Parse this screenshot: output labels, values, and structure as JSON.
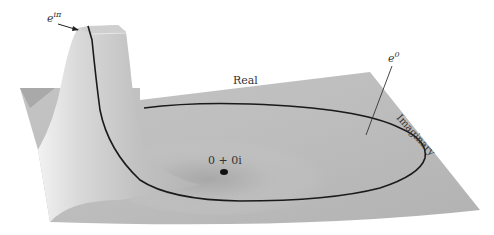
{
  "figure": {
    "labels": {
      "e_i_pi": "e",
      "e_i_pi_sup": "iπ",
      "e_zero": "e",
      "e_zero_sup": "0",
      "real_axis": "Real",
      "imaginary_axis": "Imaginary",
      "origin": "0 + 0i"
    },
    "colors": {
      "surface": "#b8b8b8",
      "surface_light": "#e6e6e6",
      "curve": "#1a1a1a",
      "background": "#ffffff"
    }
  }
}
